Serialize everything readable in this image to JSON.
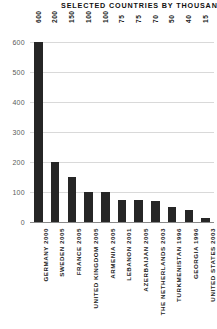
{
  "chart_data": {
    "type": "bar",
    "title": "SELECTED COUNTRIES BY THOUSANDS",
    "xlabel": "",
    "ylabel": "",
    "ylim": [
      0,
      600
    ],
    "yticks": [
      0,
      100,
      200,
      300,
      400,
      500,
      600
    ],
    "grid": true,
    "legend": false,
    "bar_color": "#262626",
    "grid_color": "#d9d9d9",
    "axis_color": "#8a8a8a",
    "background_color": "#ffffff",
    "categories": [
      "GERMANY 2000",
      "SWEDEN 2005",
      "FRANCE 2005",
      "UNITED KINGDOM 2005",
      "ARMENIA 2005",
      "LEBANON 2001",
      "AZERBAIJAN 2005",
      "THE NETHERLANDS 2003",
      "TURKMENISTAN 1996",
      "GEORGIA 1996",
      "UNITED STATES 2003"
    ],
    "values": [
      600,
      200,
      150,
      100,
      100,
      75,
      75,
      70,
      50,
      40,
      15
    ],
    "value_labels": [
      "600",
      "200",
      "150",
      "100",
      "100",
      "75",
      "75",
      "70",
      "50",
      "40",
      "15"
    ],
    "ytick_labels": [
      "0",
      "100",
      "200",
      "300",
      "400",
      "500",
      "600"
    ]
  }
}
